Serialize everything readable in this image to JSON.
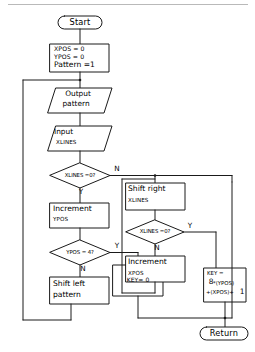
{
  "diagram": {
    "type": "flowchart",
    "stroke_color": "#1a1a1a",
    "background": "#ffffff"
  },
  "nodes": {
    "start": {
      "shape": "terminator",
      "label": "Start"
    },
    "init": {
      "shape": "process",
      "line1": "XPOS = 0",
      "line2": "YPOS = 0",
      "line3": "Pattern =1"
    },
    "output_pattern": {
      "shape": "io",
      "line1": "Output",
      "line2": "pattern"
    },
    "input_xlines": {
      "shape": "io",
      "line1": "Input",
      "line2": "XLINES"
    },
    "dec_xlines_zero_left": {
      "shape": "decision",
      "label": "XLINES =0?",
      "yes": "Y",
      "no": "N"
    },
    "increment_ypos": {
      "shape": "process",
      "line1": "Increment",
      "line2": "YPOS"
    },
    "dec_ypos_four": {
      "shape": "decision",
      "label": "YPOS = 4?",
      "yes": "Y",
      "no": "N"
    },
    "shift_left_pattern": {
      "shape": "process",
      "line1": "Shift left",
      "line2": "pattern"
    },
    "key_zero": {
      "shape": "process",
      "label": "KEY= 0"
    },
    "shift_right_xlines": {
      "shape": "process",
      "line1": "Shift right",
      "line2": "XLINES"
    },
    "dec_xlines_zero_right": {
      "shape": "decision",
      "label": "XLINES =0?",
      "yes": "Y",
      "no": "N"
    },
    "increment_xpos": {
      "shape": "process",
      "line1": "Increment",
      "line2": "XPOS"
    },
    "key_formula": {
      "shape": "process",
      "line1": "KEY =",
      "line2": "8",
      "line2b": "*(YPOS)",
      "line3": "+(XPOS)+",
      "line3b": "1"
    },
    "return": {
      "shape": "terminator",
      "label": "Return"
    }
  },
  "edge_labels": {
    "xlines_left_no": "N",
    "xlines_left_yes": "Y",
    "ypos_yes": "Y",
    "ypos_no": "N",
    "xlines_right_yes": "Y",
    "xlines_right_no": "N"
  }
}
